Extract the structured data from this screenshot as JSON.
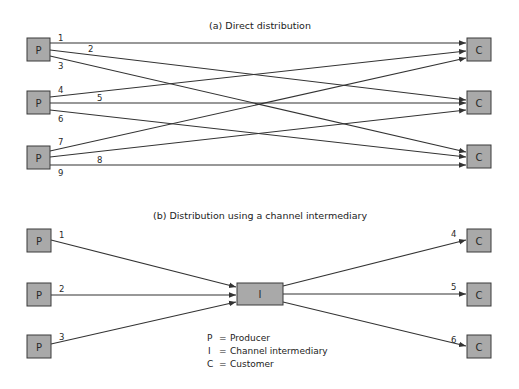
{
  "diagram_a": {
    "title": "(a) Direct distribution",
    "producer_label": "P",
    "customer_label": "C",
    "links": [
      "1",
      "2",
      "3",
      "4",
      "5",
      "6",
      "7",
      "8",
      "9"
    ]
  },
  "diagram_b": {
    "title": "(b) Distribution using a channel intermediary",
    "producer_label": "P",
    "intermediary_label": "I",
    "customer_label": "C",
    "links": [
      "1",
      "2",
      "3",
      "4",
      "5",
      "6"
    ]
  },
  "legend": [
    {
      "symbol": "P",
      "eq": "=",
      "meaning": "Producer"
    },
    {
      "symbol": "I",
      "eq": "=",
      "meaning": "Channel intermediary"
    },
    {
      "symbol": "C",
      "eq": "=",
      "meaning": "Customer"
    }
  ],
  "colors": {
    "box_fill": "#a9a9a9",
    "box_stroke": "#3a3a3a",
    "line": "#333333"
  }
}
